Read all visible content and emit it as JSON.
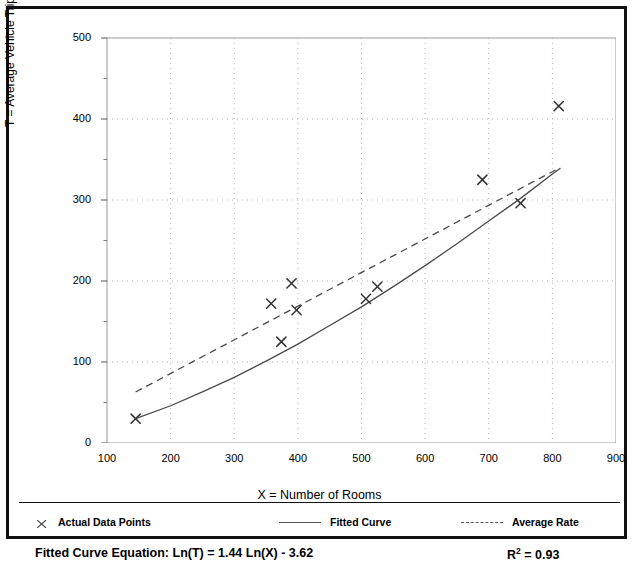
{
  "chart_data": {
    "type": "scatter",
    "title": "",
    "xlabel": "X = Number of Rooms",
    "ylabel": "T = Average Vehicle Trip Ends",
    "xlim": [
      100,
      900
    ],
    "ylim": [
      0,
      500
    ],
    "xticks": [
      100,
      200,
      300,
      400,
      500,
      600,
      700,
      800,
      900
    ],
    "yticks": [
      0,
      100,
      200,
      300,
      400,
      500
    ],
    "xminor_step": 50,
    "yminor_step": 50,
    "grid": "dotted-both",
    "legend_position": "below-axes",
    "points": [
      {
        "x": 145,
        "y": 30
      },
      {
        "x": 358,
        "y": 172
      },
      {
        "x": 374,
        "y": 125
      },
      {
        "x": 390,
        "y": 197
      },
      {
        "x": 398,
        "y": 164
      },
      {
        "x": 507,
        "y": 178
      },
      {
        "x": 525,
        "y": 193
      },
      {
        "x": 690,
        "y": 325
      },
      {
        "x": 750,
        "y": 296
      },
      {
        "x": 810,
        "y": 416
      }
    ],
    "series": [
      {
        "name": "Fitted Curve",
        "style": "solid",
        "equation": "Ln(T) = 1.44 Ln(X) - 3.62",
        "a": 1.44,
        "b": -3.62,
        "x_range": [
          145,
          812
        ],
        "points": [
          {
            "x": 145,
            "y": 30
          },
          {
            "x": 200,
            "y": 46
          },
          {
            "x": 250,
            "y": 63
          },
          {
            "x": 300,
            "y": 81
          },
          {
            "x": 350,
            "y": 101
          },
          {
            "x": 400,
            "y": 122
          },
          {
            "x": 450,
            "y": 145
          },
          {
            "x": 500,
            "y": 168
          },
          {
            "x": 550,
            "y": 193
          },
          {
            "x": 600,
            "y": 219
          },
          {
            "x": 650,
            "y": 246
          },
          {
            "x": 700,
            "y": 274
          },
          {
            "x": 750,
            "y": 302
          },
          {
            "x": 800,
            "y": 332
          },
          {
            "x": 812,
            "y": 339
          }
        ]
      },
      {
        "name": "Average Rate",
        "style": "dashed",
        "x_range": [
          145,
          812
        ],
        "points": [
          {
            "x": 145,
            "y": 63
          },
          {
            "x": 812,
            "y": 340
          }
        ]
      }
    ],
    "marker": "x",
    "r_squared": 0.93
  },
  "axis": {
    "y_tick_labels": [
      "500",
      "400",
      "300",
      "200",
      "100",
      "0"
    ],
    "x_tick_labels": [
      "100",
      "200",
      "300",
      "400",
      "500",
      "600",
      "700",
      "800",
      "900"
    ],
    "y_title": "T = Average Vehicle Trip Ends",
    "x_title": "X = Number of Rooms"
  },
  "legend": {
    "items": [
      {
        "label": "Actual Data Points",
        "swatch": "x-marker"
      },
      {
        "label": "Fitted Curve",
        "swatch": "solid-line"
      },
      {
        "label": "Average Rate",
        "swatch": "dashed-line"
      }
    ]
  },
  "footer": {
    "equation_label": "Fitted Curve Equation:",
    "equation": "Ln(T) = 1.44 Ln(X) - 3.62",
    "equation_full": "Fitted Curve Equation:  Ln(T) = 1.44 Ln(X) - 3.62",
    "r2_symbol": "R",
    "r2_exponent": "2",
    "r2_value": "= 0.93"
  },
  "colors": {
    "frame": "#111111",
    "axis": "#9a9a9a",
    "grid": "#b5b5b5",
    "curve": "#4a4a4a",
    "average": "#4a4a4a",
    "marker": "#333333",
    "background": "#ffffff"
  }
}
